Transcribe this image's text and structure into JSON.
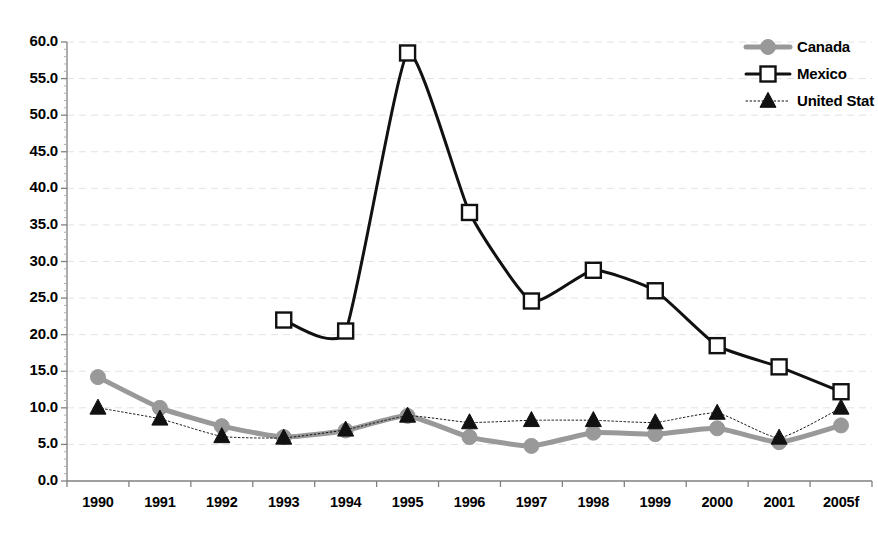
{
  "chart_data": {
    "type": "line",
    "title": "",
    "subtitle": "",
    "xlabel": "",
    "ylabel": "",
    "grid": true,
    "legend_position": "top-right",
    "categories": [
      "1990",
      "1991",
      "1992",
      "1993",
      "1994",
      "1995",
      "1996",
      "1997",
      "1998",
      "1999",
      "2000",
      "2001",
      "2005f"
    ],
    "ylim": [
      0.0,
      60.0
    ],
    "ytick_labels": [
      "0.0",
      "5.0",
      "10.0",
      "15.0",
      "20.0",
      "25.0",
      "30.0",
      "35.0",
      "40.0",
      "45.0",
      "50.0",
      "55.0",
      "60.0"
    ],
    "ytick_values": [
      0,
      5,
      10,
      15,
      20,
      25,
      30,
      35,
      40,
      45,
      50,
      55,
      60
    ],
    "series": [
      {
        "name": "Canada",
        "color": "#999999",
        "marker": "circle",
        "line_width": 5,
        "line_style": "solid",
        "values": [
          14.2,
          10.0,
          7.5,
          6.0,
          6.9,
          8.9,
          6.0,
          4.8,
          6.6,
          6.4,
          7.2,
          5.3,
          7.6
        ]
      },
      {
        "name": "Mexico",
        "color": "#111111",
        "marker": "square-open",
        "line_width": 3,
        "line_style": "solid",
        "values": [
          null,
          null,
          null,
          22.0,
          20.5,
          58.5,
          36.7,
          24.6,
          28.8,
          26.0,
          18.5,
          15.6,
          12.2
        ]
      },
      {
        "name": "United States",
        "color": "#111111",
        "marker": "triangle",
        "line_width": 1,
        "line_style": "dotted",
        "values": [
          10.0,
          8.5,
          6.1,
          5.9,
          7.0,
          8.9,
          8.0,
          8.3,
          8.3,
          8.0,
          9.3,
          5.9,
          10.0
        ]
      }
    ]
  },
  "legend": {
    "entries": [
      {
        "label": "Canada"
      },
      {
        "label": "Mexico"
      },
      {
        "label": "United Stat"
      }
    ]
  },
  "colors": {
    "canada": "#999999",
    "mexico": "#111111",
    "united_states": "#111111",
    "gridline": "#e2e2e2",
    "axis": "#808080",
    "background": "#ffffff"
  }
}
